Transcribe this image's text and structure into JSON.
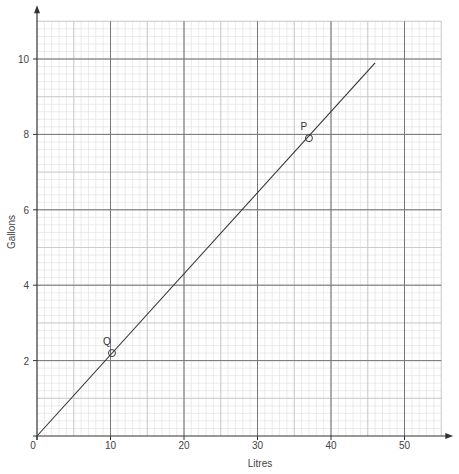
{
  "chart_data": {
    "type": "line",
    "title": "",
    "xlabel": "Litres",
    "ylabel": "Gallons",
    "xlim": [
      0,
      55
    ],
    "ylim": [
      0,
      11
    ],
    "xticks": [
      0,
      10,
      20,
      30,
      40,
      50
    ],
    "yticks": [
      2,
      4,
      6,
      8,
      10
    ],
    "xtick_labels": [
      "0",
      "10",
      "20",
      "30",
      "40",
      "50"
    ],
    "ytick_labels": [
      "2",
      "4",
      "6",
      "8",
      "10"
    ],
    "grid": true,
    "grid_minor_step_x": 2,
    "grid_minor_step_y": 0.4,
    "series": [
      {
        "name": "conversion",
        "x": [
          0,
          46
        ],
        "y": [
          0,
          9.9
        ]
      }
    ],
    "points": [
      {
        "label": "P",
        "x": 37,
        "y": 7.9
      },
      {
        "label": "Q",
        "x": 10.2,
        "y": 2.2
      }
    ]
  }
}
